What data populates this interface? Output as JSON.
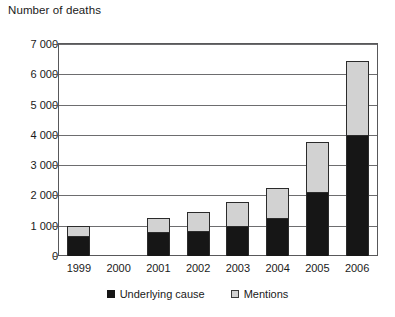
{
  "chart_data": {
    "type": "bar",
    "stacked": true,
    "title": "Number of deaths",
    "xlabel": "",
    "ylabel": "",
    "ylim": [
      0,
      7000
    ],
    "ytick_step": 1000,
    "grid": true,
    "legend_position": "bottom",
    "categories": [
      "1999",
      "2000",
      "2001",
      "2002",
      "2003",
      "2004",
      "2005",
      "2006"
    ],
    "ytick_labels": [
      "0",
      "1 000",
      "2 000",
      "3 000",
      "4 000",
      "5 000",
      "6 000",
      "7 000"
    ],
    "series": [
      {
        "name": "Underlying cause",
        "color": "#161616",
        "values": [
          650,
          0,
          780,
          820,
          980,
          1250,
          2100,
          4000
        ]
      },
      {
        "name": "Mentions",
        "color": "#d2d2d2",
        "values": [
          350,
          0,
          470,
          620,
          820,
          1000,
          1650,
          2450
        ]
      }
    ],
    "totals": [
      1000,
      0,
      1250,
      1440,
      1800,
      2250,
      3750,
      6450
    ]
  },
  "legend": {
    "items": [
      {
        "label": "Underlying cause",
        "swatch": "black-square-icon"
      },
      {
        "label": "Mentions",
        "swatch": "gray-square-icon"
      }
    ]
  },
  "colors": {
    "underlying_cause": "#161616",
    "mentions": "#d2d2d2",
    "axis": "#58585a",
    "gridline": "#6d6d6f",
    "text": "#1a1a1a",
    "background": "#ffffff"
  }
}
